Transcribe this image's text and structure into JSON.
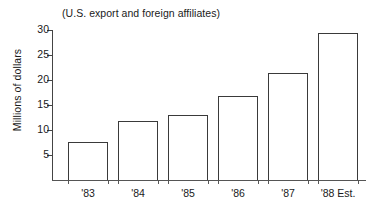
{
  "chart_data": {
    "type": "bar",
    "title": "(U.S. export and foreign affiliates)",
    "xlabel": "",
    "ylabel": "Millions of dollars",
    "categories": [
      "'83",
      "'84",
      "'85",
      "'86",
      "'87",
      "'88 Est."
    ],
    "values": [
      7.6,
      11.8,
      13.0,
      16.8,
      21.5,
      29.5
    ],
    "ylim": [
      0,
      30
    ],
    "yticks": [
      5,
      10,
      15,
      20,
      25,
      30
    ],
    "ytick_labels": [
      "5",
      "10",
      "15",
      "20",
      "25",
      "30"
    ],
    "grid": false,
    "legend": null,
    "bar_fill": "#ffffff",
    "bar_edge": "#3a3a3a",
    "axis_color": "#444444",
    "text_color": "#1a1a1a"
  }
}
